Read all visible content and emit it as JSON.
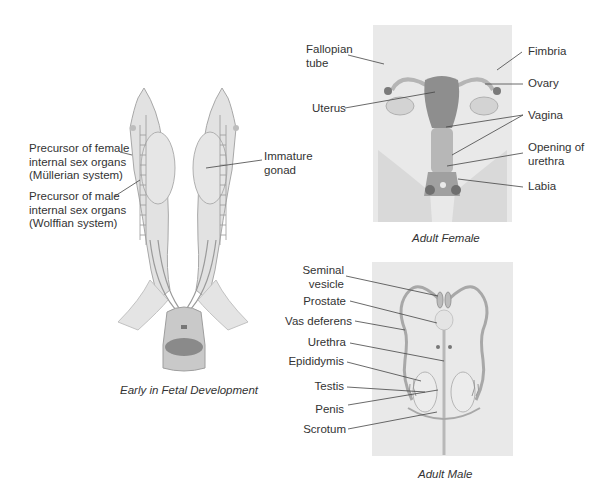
{
  "fetal": {
    "caption": "Early in Fetal Development",
    "labels": {
      "mullerian": [
        "Precursor of female",
        "internal sex organs",
        "(Müllerian system)"
      ],
      "wolffian": [
        "Precursor of male",
        "internal sex organs",
        "(Wolffian system)"
      ],
      "gonad": [
        "Immature",
        "gonad"
      ]
    }
  },
  "female": {
    "caption": "Adult Female",
    "labels": {
      "fallopian_tube": [
        "Fallopian",
        "tube"
      ],
      "uterus": "Uterus",
      "fimbria": "Fimbria",
      "ovary": "Ovary",
      "vagina": "Vagina",
      "opening_of_urethra": [
        "Opening of",
        "urethra"
      ],
      "labia": "Labia"
    }
  },
  "male": {
    "caption": "Adult Male",
    "labels": {
      "seminal_vesicle": [
        "Seminal",
        "vesicle"
      ],
      "prostate": "Prostate",
      "vas_deferens": "Vas deferens",
      "urethra": "Urethra",
      "epididymis": "Epididymis",
      "testis": "Testis",
      "penis": "Penis",
      "scrotum": "Scrotum"
    }
  },
  "colors": {
    "panel_bg": "#e9e9e9",
    "tissue_light": "#dedede",
    "tissue_mid": "#c8c8c8",
    "tissue_dark": "#8a8a8a",
    "leader_line": "#444444"
  }
}
